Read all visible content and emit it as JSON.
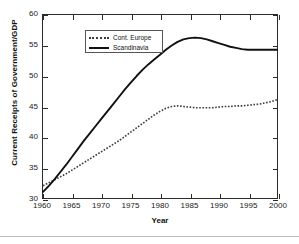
{
  "chart_data": {
    "type": "line",
    "title": "",
    "xlabel": "Year",
    "ylabel": "Current Receipts of Government/GDP",
    "xlim": [
      1960,
      2000
    ],
    "ylim": [
      30,
      60
    ],
    "xticks": [
      1960,
      1965,
      1970,
      1975,
      1980,
      1985,
      1990,
      1995,
      2000
    ],
    "yticks": [
      30,
      35,
      40,
      45,
      50,
      55,
      60
    ],
    "grid": false,
    "legend_position": "upper left",
    "x": [
      1960,
      1961,
      1962,
      1963,
      1964,
      1965,
      1966,
      1967,
      1968,
      1969,
      1970,
      1971,
      1972,
      1973,
      1974,
      1975,
      1976,
      1977,
      1978,
      1979,
      1980,
      1981,
      1982,
      1983,
      1984,
      1985,
      1986,
      1987,
      1988,
      1989,
      1990,
      1991,
      1992,
      1993,
      1994,
      1995,
      1996,
      1997,
      1998,
      1999,
      2000
    ],
    "series": [
      {
        "name": "Cont. Europe",
        "style": "dotted",
        "color": "#3a3a3a",
        "values": [
          32.0,
          32.5,
          33.0,
          33.5,
          34.0,
          34.6,
          35.2,
          35.8,
          36.4,
          37.0,
          37.6,
          38.2,
          38.8,
          39.4,
          40.1,
          40.8,
          41.5,
          42.2,
          42.9,
          43.6,
          44.2,
          44.7,
          45.0,
          45.1,
          45.0,
          44.9,
          44.8,
          44.8,
          44.8,
          44.8,
          44.9,
          45.0,
          45.0,
          45.1,
          45.1,
          45.2,
          45.3,
          45.4,
          45.6,
          45.8,
          46.1
        ]
      },
      {
        "name": "Scandinavia",
        "style": "solid",
        "color": "#111111",
        "values": [
          31.0,
          32.0,
          33.1,
          34.3,
          35.5,
          36.8,
          38.1,
          39.4,
          40.6,
          41.8,
          43.0,
          44.2,
          45.4,
          46.6,
          47.8,
          48.9,
          50.0,
          51.0,
          51.9,
          52.7,
          53.5,
          54.3,
          55.0,
          55.6,
          56.0,
          56.2,
          56.3,
          56.2,
          56.0,
          55.7,
          55.4,
          55.1,
          54.8,
          54.6,
          54.4,
          54.3,
          54.3,
          54.3,
          54.3,
          54.3,
          54.3
        ]
      }
    ]
  },
  "legend": {
    "items": [
      {
        "label": "Cont. Europe"
      },
      {
        "label": "Scandinavia"
      }
    ]
  },
  "axes": {
    "x_title": "Year",
    "y_title": "Current Receipts of Government/GDP"
  }
}
